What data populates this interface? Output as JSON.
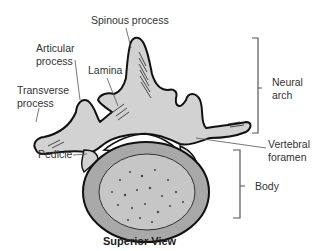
{
  "diagram": {
    "subject": "Vertebra",
    "caption": "Superior View",
    "labels": {
      "spinous_process": "Spinous process",
      "articular_process_1": "Articular",
      "articular_process_2": "process",
      "lamina": "Lamina",
      "transverse_process_1": "Transverse",
      "transverse_process_2": "process",
      "pedicle": "Pedicle",
      "neural_arch_1": "Neural",
      "neural_arch_2": "arch",
      "vertebral_foramen_1": "Vertebral",
      "vertebral_foramen_2": "foramen",
      "body": "Body"
    },
    "groups": [
      {
        "name": "Neural arch",
        "members": [
          "Spinous process",
          "Articular process",
          "Lamina",
          "Transverse process"
        ]
      },
      {
        "name": "Body",
        "members": [
          "Vertebral body"
        ]
      }
    ],
    "colors": {
      "bone_fill": "#cfcfcf",
      "body_rim": "#a9a9a9",
      "cancellous": "#c4c4c4",
      "outline": "#111111",
      "leader": "#555555",
      "text": "#333333"
    }
  }
}
